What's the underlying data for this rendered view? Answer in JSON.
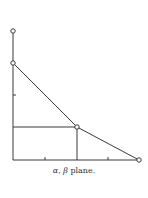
{
  "figure": {
    "caption": "α, β plane.",
    "caption_parts": {
      "alpha": "α",
      "sep": ", ",
      "beta": "β",
      "rest": " plane."
    },
    "line_color": "#3a3a3a",
    "background": "#ffffff"
  },
  "diagram": {
    "axes": {
      "origin": [
        13,
        160
      ],
      "x_end": [
        139,
        160
      ],
      "y_top": [
        13,
        31
      ],
      "x_ticks_px": [
        45,
        108
      ],
      "y_ticks_px": [
        95
      ]
    },
    "points": [
      {
        "id": "top-open",
        "x": 13,
        "y": 31
      },
      {
        "id": "y-intercept",
        "x": 13,
        "y": 63
      },
      {
        "id": "vertex",
        "x": 77,
        "y": 127
      },
      {
        "id": "x-intercept",
        "x": 139,
        "y": 160
      }
    ],
    "polyline": [
      [
        13,
        63
      ],
      [
        77,
        127
      ],
      [
        139,
        160
      ]
    ],
    "guides": [
      {
        "from": [
          13,
          127
        ],
        "to": [
          77,
          127
        ]
      },
      {
        "from": [
          77,
          127
        ],
        "to": [
          77,
          160
        ]
      }
    ]
  }
}
